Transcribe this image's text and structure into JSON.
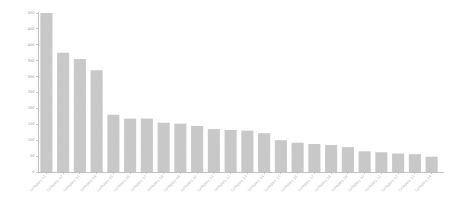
{
  "chart_data": {
    "type": "bar",
    "title": "",
    "subtitle": "",
    "xlabel": "",
    "ylabel": "",
    "ylim": [
      0,
      500
    ],
    "xlim": [
      0,
      24
    ],
    "grid": false,
    "legend": null,
    "legend_position": "none",
    "orientation": "vertical",
    "sorted": "descending",
    "bar_color": "#c9c9c9",
    "axis_color": "#b2b2b2",
    "tick_label_color": "#9a9a9a",
    "xtick_label_color": "#b4b4b4",
    "xtick_label_rotation": -45,
    "ytick_values": [
      0,
      50,
      100,
      150,
      200,
      250,
      300,
      350,
      400,
      450,
      500
    ],
    "ytick_labels": [
      "0",
      "50",
      "100",
      "150",
      "200",
      "250",
      "300",
      "350",
      "400",
      "450",
      "500"
    ],
    "categories": [
      "Category 01",
      "Category 02",
      "Category 03",
      "Category 04",
      "Category 05",
      "Category 06",
      "Category 07",
      "Category 08",
      "Category 09",
      "Category 10",
      "Category 11",
      "Category 12",
      "Category 13",
      "Category 14",
      "Category 15",
      "Category 16",
      "Category 17",
      "Category 18",
      "Category 19",
      "Category 20",
      "Category 21",
      "Category 22",
      "Category 23",
      "Category 24"
    ],
    "values": [
      500,
      375,
      355,
      320,
      180,
      168,
      168,
      155,
      152,
      145,
      135,
      132,
      130,
      122,
      100,
      92,
      88,
      85,
      78,
      65,
      62,
      58,
      56,
      48
    ]
  },
  "figure": {
    "background": "#ffffff",
    "plot_area": {
      "left": 38,
      "right": 440,
      "top": 13,
      "bottom": 172
    }
  }
}
